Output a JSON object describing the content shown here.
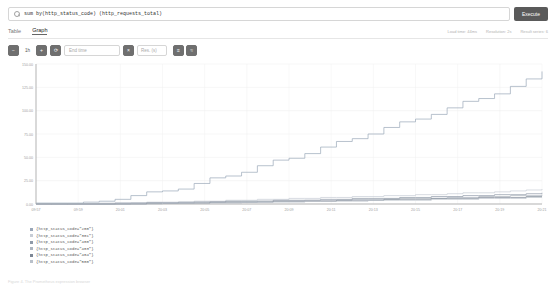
{
  "search": {
    "icon": "search-icon",
    "query": "sum by(http_status_code) (http_requests_total)",
    "placeholder": "Expression (press Shift+Enter for newlines)"
  },
  "toolbar": {
    "execute_label": "Execute"
  },
  "tabs": [
    {
      "label": "Table",
      "active": false
    },
    {
      "label": "Graph",
      "active": true
    }
  ],
  "meta": {
    "load_time": "Load time: 44ms",
    "resolution": "Resolution: 2s",
    "result_series": "Result series: 6"
  },
  "controls": {
    "zoom_out": "−",
    "range_value": "1h",
    "zoom_in": "+",
    "refresh": "⟳",
    "end_time_placeholder": "End time",
    "clear_end_time": "×",
    "resolution_placeholder": "Res. (s)",
    "stacked_label": "≡",
    "lines_label": "≈"
  },
  "chart_data": {
    "type": "line",
    "title": "",
    "xlabel": "",
    "ylabel": "",
    "grid": true,
    "legend_position": "bottom-left",
    "ylim": [
      0,
      150
    ],
    "yticks": [
      0,
      25,
      50,
      75,
      100,
      125,
      150
    ],
    "ytick_labels": [
      "0.00",
      "25.00",
      "50.00",
      "75.00",
      "100.00",
      "125.00",
      "150.00"
    ],
    "xtick_labels": [
      "09:57",
      "09:59",
      "20:01",
      "20:03",
      "20:05",
      "20:07",
      "20:09",
      "20:11",
      "20:13",
      "20:15",
      "20:17",
      "20:19",
      "20:21"
    ],
    "series": [
      {
        "name": "{http_status_code=\"200\"}",
        "color": "#9aa7b8",
        "values": [
          1,
          1,
          1,
          2,
          3,
          5,
          9,
          13,
          14,
          16,
          22,
          28,
          30,
          34,
          41,
          47,
          49,
          54,
          61,
          67,
          70,
          75,
          82,
          88,
          91,
          96,
          103,
          110,
          113,
          118,
          126,
          134,
          142
        ]
      },
      {
        "name": "{http_status_code=\"301\"}",
        "color": "#c7cdd6",
        "values": [
          0,
          0,
          0,
          0,
          1,
          1,
          1,
          2,
          2,
          2,
          3,
          3,
          4,
          4,
          5,
          5,
          6,
          6,
          7,
          7,
          8,
          8,
          9,
          9,
          10,
          10,
          11,
          12,
          12,
          13,
          14,
          15,
          16
        ]
      },
      {
        "name": "{http_status_code=\"400\"}",
        "color": "#8f9aa8",
        "values": [
          0,
          0,
          0,
          0,
          0,
          1,
          1,
          1,
          1,
          2,
          2,
          2,
          3,
          3,
          3,
          4,
          4,
          4,
          5,
          5,
          6,
          6,
          6,
          7,
          7,
          8,
          8,
          9,
          9,
          10,
          10,
          11,
          12
        ]
      },
      {
        "name": "{http_status_code=\"403\"}",
        "color": "#adb5bf",
        "values": [
          0,
          0,
          0,
          0,
          0,
          0,
          1,
          1,
          1,
          1,
          2,
          2,
          2,
          2,
          3,
          3,
          3,
          4,
          4,
          4,
          5,
          5,
          5,
          6,
          6,
          6,
          7,
          7,
          8,
          8,
          9,
          9,
          10
        ]
      },
      {
        "name": "{http_status_code=\"404\"}",
        "color": "#7d8795",
        "values": [
          0,
          0,
          0,
          0,
          0,
          0,
          0,
          1,
          1,
          1,
          1,
          2,
          2,
          2,
          2,
          3,
          3,
          3,
          3,
          4,
          4,
          4,
          5,
          5,
          5,
          6,
          6,
          6,
          7,
          7,
          7,
          8,
          8
        ]
      },
      {
        "name": "{http_status_code=\"500\"}",
        "color": "#b9c0c9",
        "values": [
          0,
          0,
          0,
          0,
          0,
          0,
          0,
          0,
          1,
          1,
          1,
          1,
          1,
          2,
          2,
          2,
          2,
          3,
          3,
          3,
          3,
          4,
          4,
          4,
          4,
          5,
          5,
          5,
          6,
          6,
          6,
          7,
          7
        ]
      }
    ]
  },
  "footer": {
    "caption": "Figure 4. The Prometheus expression browser"
  }
}
